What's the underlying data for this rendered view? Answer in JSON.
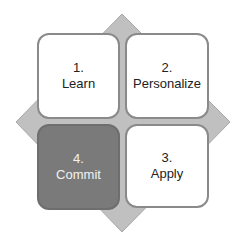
{
  "colors": {
    "diamond_fill": "#c0c0c0",
    "diamond_stroke": "#9a9a9a",
    "box_fill": "#ffffff",
    "box_border": "#8a8a8a",
    "highlight_fill": "#7a7a7a",
    "highlight_text": "#f2f2f2"
  },
  "steps": [
    {
      "number": "1.",
      "label": "Learn"
    },
    {
      "number": "2.",
      "label": "Personalize"
    },
    {
      "number": "3.",
      "label": "Apply"
    },
    {
      "number": "4.",
      "label": "Commit"
    }
  ]
}
